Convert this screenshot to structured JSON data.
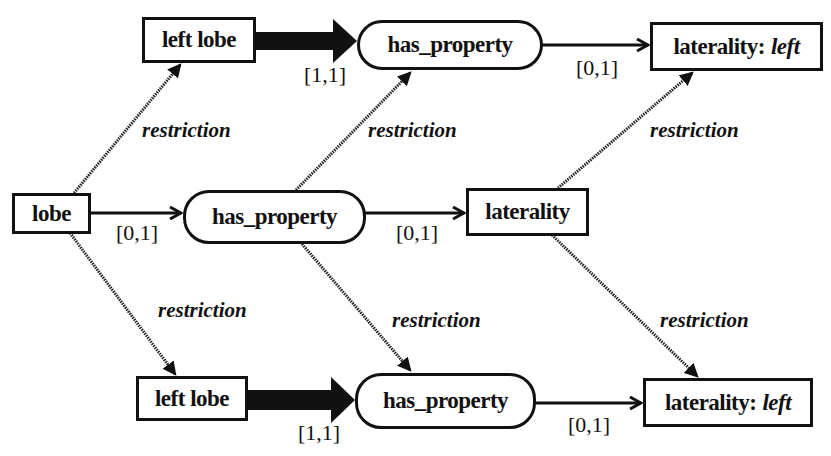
{
  "diagram": {
    "nodes": {
      "lobe": {
        "label": "lobe",
        "shape": "rect"
      },
      "left_lobe_top": {
        "label": "left lobe",
        "shape": "rect"
      },
      "has_property_top": {
        "label": "has_property",
        "shape": "rounded"
      },
      "laterality_left_top": {
        "label": "laterality:",
        "value": "left",
        "shape": "rect"
      },
      "has_property_mid": {
        "label": "has_property",
        "shape": "rounded"
      },
      "laterality_mid": {
        "label": "laterality",
        "shape": "rect"
      },
      "left_lobe_bottom": {
        "label": "left lobe",
        "shape": "rect"
      },
      "has_property_bottom": {
        "label": "has_property",
        "shape": "rounded"
      },
      "laterality_left_bottom": {
        "label": "laterality:",
        "value": "left",
        "shape": "rect"
      }
    },
    "edge_labels": {
      "card_top_thick": "[1,1]",
      "card_top_right": "[0,1]",
      "card_mid_left": "[0,1]",
      "card_mid_right": "[0,1]",
      "card_bottom_thick": "[1,1]",
      "card_bottom_right": "[0,1]",
      "restriction_top_left": "restriction",
      "restriction_top_mid": "restriction",
      "restriction_top_right": "restriction",
      "restriction_bottom_left": "restriction",
      "restriction_bottom_mid": "restriction",
      "restriction_bottom_right": "restriction"
    },
    "edges": [
      {
        "from": "lobe",
        "to": "has_property_mid",
        "type": "arrow",
        "label": "[0,1]"
      },
      {
        "from": "has_property_mid",
        "to": "laterality_mid",
        "type": "arrow",
        "label": "[0,1]"
      },
      {
        "from": "left_lobe_top",
        "to": "has_property_top",
        "type": "thick-arrow",
        "label": "[1,1]"
      },
      {
        "from": "has_property_top",
        "to": "laterality_left_top",
        "type": "arrow",
        "label": "[0,1]"
      },
      {
        "from": "left_lobe_bottom",
        "to": "has_property_bottom",
        "type": "thick-arrow",
        "label": "[1,1]"
      },
      {
        "from": "has_property_bottom",
        "to": "laterality_left_bottom",
        "type": "arrow",
        "label": "[0,1]"
      },
      {
        "from": "lobe",
        "to": "left_lobe_top",
        "type": "restriction",
        "label": "restriction"
      },
      {
        "from": "has_property_mid",
        "to": "has_property_top",
        "type": "restriction",
        "label": "restriction"
      },
      {
        "from": "laterality_mid",
        "to": "laterality_left_top",
        "type": "restriction",
        "label": "restriction"
      },
      {
        "from": "lobe",
        "to": "left_lobe_bottom",
        "type": "restriction",
        "label": "restriction"
      },
      {
        "from": "has_property_mid",
        "to": "has_property_bottom",
        "type": "restriction",
        "label": "restriction"
      },
      {
        "from": "laterality_mid",
        "to": "laterality_left_bottom",
        "type": "restriction",
        "label": "restriction"
      }
    ],
    "colors": {
      "ink": "#111111",
      "background": "#ffffff"
    }
  }
}
